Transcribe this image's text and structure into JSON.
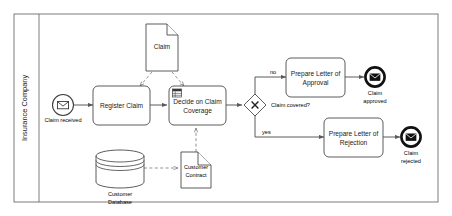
{
  "diagram": {
    "type": "bpmn-process",
    "pool": {
      "label": "Insurance Company"
    },
    "events": [
      {
        "id": "start-claim-received",
        "label": "Claim received",
        "kind": "message-start-event",
        "icon": "envelope-icon"
      },
      {
        "id": "end-claim-approved",
        "label": "Claim approved",
        "kind": "message-end-event",
        "icon": "envelope-icon"
      },
      {
        "id": "end-claim-rejected",
        "label": "Claim rejected",
        "kind": "message-end-event",
        "icon": "envelope-icon"
      }
    ],
    "tasks": [
      {
        "id": "task-register-claim",
        "label": "Register Claim",
        "kind": "task"
      },
      {
        "id": "task-decide-coverage",
        "label": "Decide on Claim Coverage",
        "kind": "business-rule-task",
        "icon": "business-rule-icon"
      },
      {
        "id": "task-prepare-approval",
        "label": "Prepare Letter of Approval",
        "kind": "task"
      },
      {
        "id": "task-prepare-rejection",
        "label": "Prepare Letter of Rejection",
        "kind": "task"
      }
    ],
    "gateway": {
      "id": "gateway-claim-covered",
      "label": "Claim covered?",
      "kind": "exclusive-gateway",
      "marker": "X"
    },
    "flow_labels": {
      "no": "no",
      "yes": "yes"
    },
    "data_objects": [
      {
        "id": "data-claim",
        "label": "Claim",
        "kind": "data-object"
      },
      {
        "id": "data-customer-contract",
        "label": "Customer Contract",
        "kind": "data-object"
      }
    ],
    "data_stores": [
      {
        "id": "store-customer-database",
        "label": "Customer Database",
        "kind": "data-store"
      }
    ],
    "colors": {
      "shape_stroke": "#4a4a4a",
      "flow_stroke": "#5a5a5a",
      "text": "#1a1a1a",
      "background": "#ffffff",
      "end_event_stroke": "#111111"
    }
  }
}
